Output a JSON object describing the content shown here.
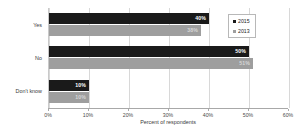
{
  "chart_data": {
    "type": "bar",
    "orientation": "horizontal",
    "title": "",
    "subtitle": "",
    "xlabel": "Percent of respondents",
    "ylabel": "",
    "categories": [
      "Yes",
      "No",
      "Don't know"
    ],
    "series": [
      {
        "name": "2015",
        "color": "#1a1a1a",
        "values": [
          40,
          50,
          10
        ],
        "labels": [
          "40%",
          "50%",
          "10%"
        ]
      },
      {
        "name": "2013",
        "color": "#9e9e9e",
        "values": [
          38,
          51,
          10
        ],
        "labels": [
          "38%",
          "51%",
          "10%"
        ]
      }
    ],
    "xlim": [
      0,
      60
    ],
    "xticks": [
      0,
      10,
      20,
      30,
      40,
      50,
      60
    ],
    "xtick_labels": [
      "0%",
      "10%",
      "20%",
      "30%",
      "40%",
      "50%",
      "60%"
    ],
    "grid": true,
    "grid_axis": "x",
    "legend_position": "top-right",
    "legend_entries": [
      "2015",
      "2013"
    ]
  },
  "colors": {
    "series_2015": "#1a1a1a",
    "series_2013": "#9e9e9e",
    "gridline": "#d8d8d8",
    "axis": "#a8a8a8",
    "background": "#ffffff"
  }
}
